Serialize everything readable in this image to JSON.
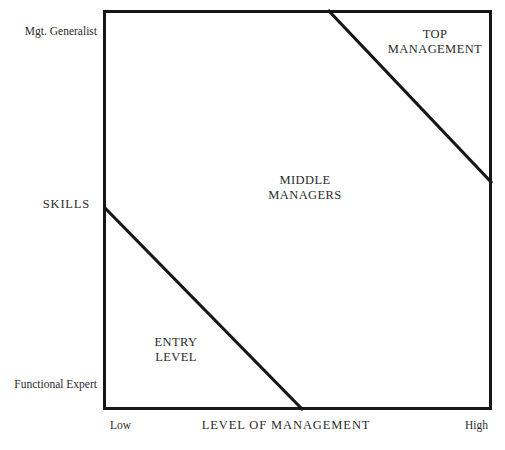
{
  "diagram": {
    "title": "",
    "background_color": "#ffffff",
    "line_color": "#161616",
    "text_color": "#2b2b2b",
    "frame": {
      "left": 103,
      "top": 10,
      "width": 389,
      "height": 400,
      "border_px": 3
    },
    "zones": [
      {
        "id": "top-management",
        "lines": [
          "TOP",
          "MANAGEMENT"
        ],
        "line1": "TOP",
        "line2": "MANAGEMENT"
      },
      {
        "id": "middle-managers",
        "lines": [
          "MIDDLE",
          "MANAGERS"
        ],
        "line1": "MIDDLE",
        "line2": "MANAGERS"
      },
      {
        "id": "entry-level",
        "lines": [
          "ENTRY",
          "LEVEL"
        ],
        "line1": "ENTRY",
        "line2": "LEVEL"
      }
    ],
    "y_axis": {
      "title": "SKILLS",
      "top_label": "Mgt. Generalist",
      "bottom_label": "Functional Expert"
    },
    "x_axis": {
      "title": "LEVEL  OF  MANAGEMENT",
      "low_label": "Low",
      "high_label": "High"
    },
    "divider_lines": [
      {
        "id": "upper-divider",
        "x1": 328,
        "y1": 10,
        "x2": 492,
        "y2": 183
      },
      {
        "id": "lower-divider",
        "x1": 104,
        "y1": 207,
        "x2": 303,
        "y2": 410
      }
    ]
  },
  "chart_data": {
    "type": "diagram",
    "title": "",
    "xlabel": "LEVEL  OF  MANAGEMENT",
    "ylabel": "SKILLS",
    "x_tick_labels": [
      "Low",
      "High"
    ],
    "y_tick_labels": [
      "Functional Expert",
      "Mgt. Generalist"
    ],
    "grid": false,
    "legend": "none",
    "regions": [
      {
        "name": "TOP MANAGEMENT",
        "position": "upper-right-triangle"
      },
      {
        "name": "MIDDLE MANAGERS",
        "position": "central-band"
      },
      {
        "name": "ENTRY LEVEL",
        "position": "lower-left-triangle"
      }
    ],
    "boundaries": [
      {
        "name": "top-management boundary",
        "from": [
          328,
          10
        ],
        "to": [
          492,
          183
        ]
      },
      {
        "name": "entry-level boundary",
        "from": [
          104,
          207
        ],
        "to": [
          303,
          410
        ]
      }
    ]
  }
}
